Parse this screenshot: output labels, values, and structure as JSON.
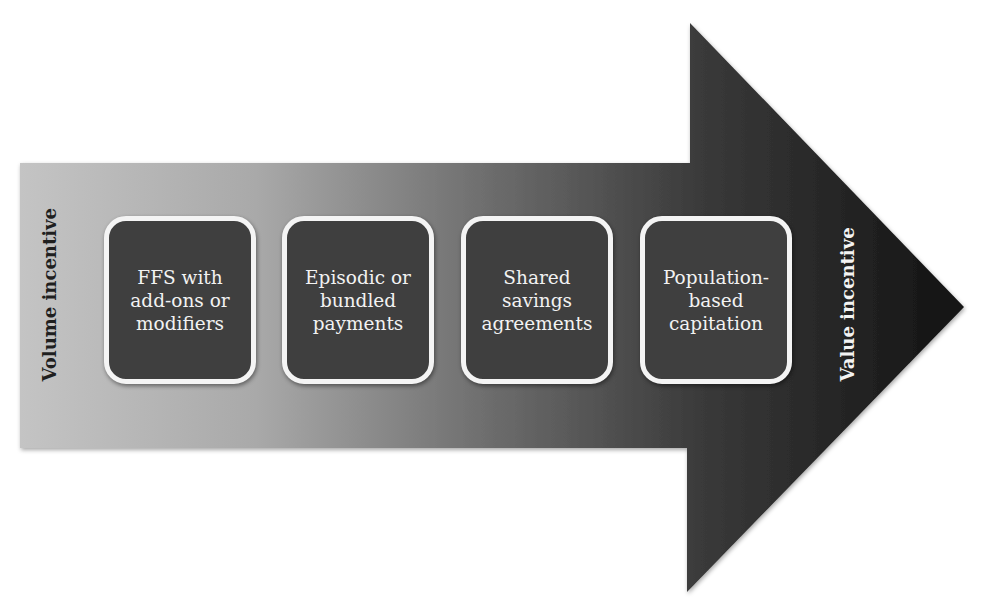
{
  "diagram": {
    "type": "progression-arrow",
    "left_label": "Volume incentive",
    "right_label": "Value incentive",
    "steps": [
      {
        "label": "FFS with\nadd-ons or\nmodifiers"
      },
      {
        "label": "Episodic or\nbundled\npayments"
      },
      {
        "label": "Shared\nsavings\nagreements"
      },
      {
        "label": "Population-\nbased\ncapitation"
      }
    ],
    "colors": {
      "arrow_start": "#c2c2c2",
      "arrow_mid": "#6a6a6a",
      "arrow_end": "#141414",
      "box_fill": "#3f3f3f",
      "box_border": "#f4f4f4",
      "box_text": "#f2f2f2"
    }
  }
}
